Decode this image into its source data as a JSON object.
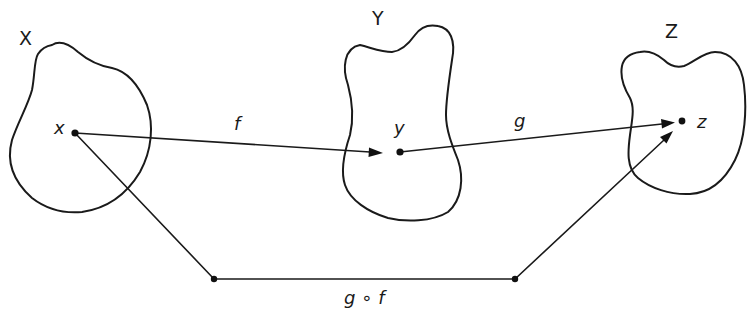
{
  "diagram": {
    "type": "function-composition",
    "sets": [
      {
        "id": "X",
        "label": "X"
      },
      {
        "id": "Y",
        "label": "Y"
      },
      {
        "id": "Z",
        "label": "Z"
      }
    ],
    "elements": [
      {
        "id": "x",
        "label": "x",
        "in_set": "X"
      },
      {
        "id": "y",
        "label": "y",
        "in_set": "Y"
      },
      {
        "id": "z",
        "label": "z",
        "in_set": "Z"
      }
    ],
    "maps": [
      {
        "id": "f",
        "label": "f",
        "from": "x",
        "to": "y"
      },
      {
        "id": "g",
        "label": "g",
        "from": "y",
        "to": "z"
      },
      {
        "id": "gof",
        "label": "g ∘ f",
        "from": "x",
        "to": "z",
        "path": "bent"
      }
    ],
    "colors": {
      "stroke": "#1a1a1a",
      "background": "#ffffff"
    }
  }
}
